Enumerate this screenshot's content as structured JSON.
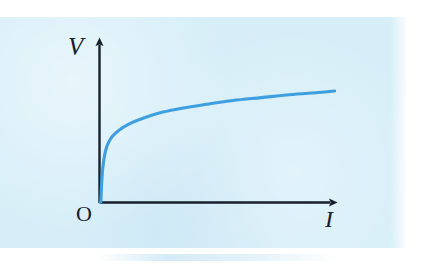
{
  "figure": {
    "panel_background_color": "#d6eef8",
    "page_background_color": "#ffffff",
    "axis_color": "#16202c",
    "curve_color": "#3d9fe0"
  },
  "labels": {
    "y_axis": "V",
    "x_axis": "I",
    "origin": "O"
  },
  "chart_data": {
    "type": "line",
    "title": "",
    "subtitle": "",
    "xlabel": "I",
    "ylabel": "V",
    "grid": false,
    "legend": null,
    "axis_style": "arrowed-quadrant-1",
    "xlim": [
      0,
      10
    ],
    "ylim": [
      0,
      10
    ],
    "tick_labels": {
      "x": [],
      "y": []
    },
    "annotations": [
      {
        "text": "O",
        "x": 0,
        "y": 0,
        "position": "origin"
      },
      {
        "text": "V",
        "x": 0,
        "y": 10,
        "position": "y-axis-top"
      },
      {
        "text": "I",
        "x": 10,
        "y": 0,
        "position": "x-axis-end"
      }
    ],
    "series": [
      {
        "name": "V-I characteristic",
        "color": "#3d9fe0",
        "x": [
          0.02,
          0.05,
          0.1,
          0.18,
          0.3,
          0.5,
          0.8,
          1.2,
          1.8,
          2.6,
          3.5,
          4.5,
          5.6,
          6.8,
          8.0,
          9.2,
          9.9
        ],
        "y": [
          0.1,
          1.2,
          2.3,
          3.2,
          3.9,
          4.45,
          4.9,
          5.3,
          5.7,
          6.1,
          6.4,
          6.65,
          6.9,
          7.1,
          7.3,
          7.45,
          7.55
        ]
      }
    ]
  }
}
